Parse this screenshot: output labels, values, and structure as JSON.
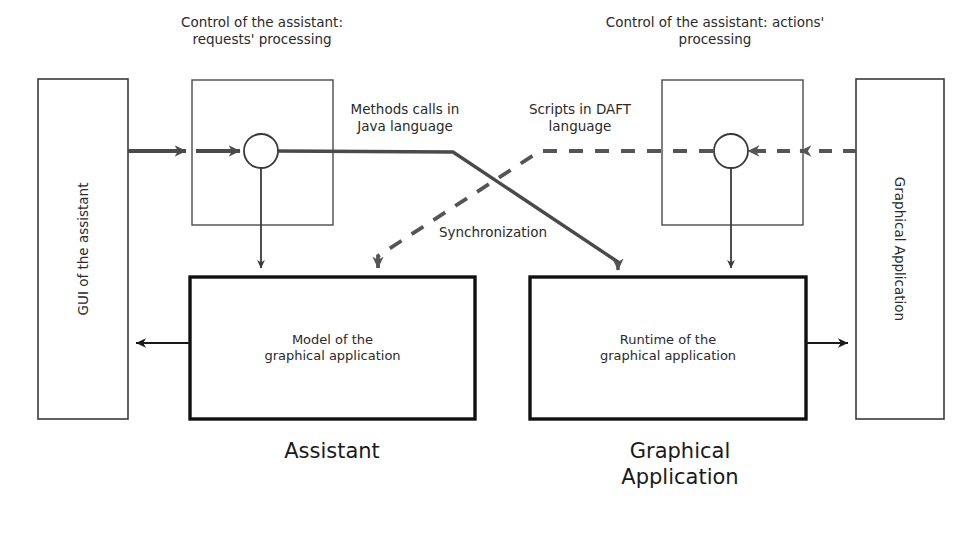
{
  "diagram": {
    "title_top_left": "Control of the assistant:\nrequests' processing",
    "title_top_right": "Control of the assistant: actions'\nprocessing",
    "edge_labels": {
      "methods_calls": "Methods calls in\nJava language",
      "scripts_daft": "Scripts in DAFT\nlanguage",
      "synchronization": "Synchronization"
    },
    "boxes": {
      "gui": "GUI of the assistant",
      "graphical_application_side": "Graphical Application",
      "model": "Model of the\ngraphical application",
      "runtime": "Runtime of the\ngraphical application"
    },
    "captions": {
      "assistant": "Assistant",
      "graphical_application": "Graphical\nApplication"
    },
    "colors": {
      "stroke": "#3a3a3a",
      "stroke_bold": "#111111",
      "background": "#ffffff",
      "text": "#2a2a2a"
    }
  }
}
